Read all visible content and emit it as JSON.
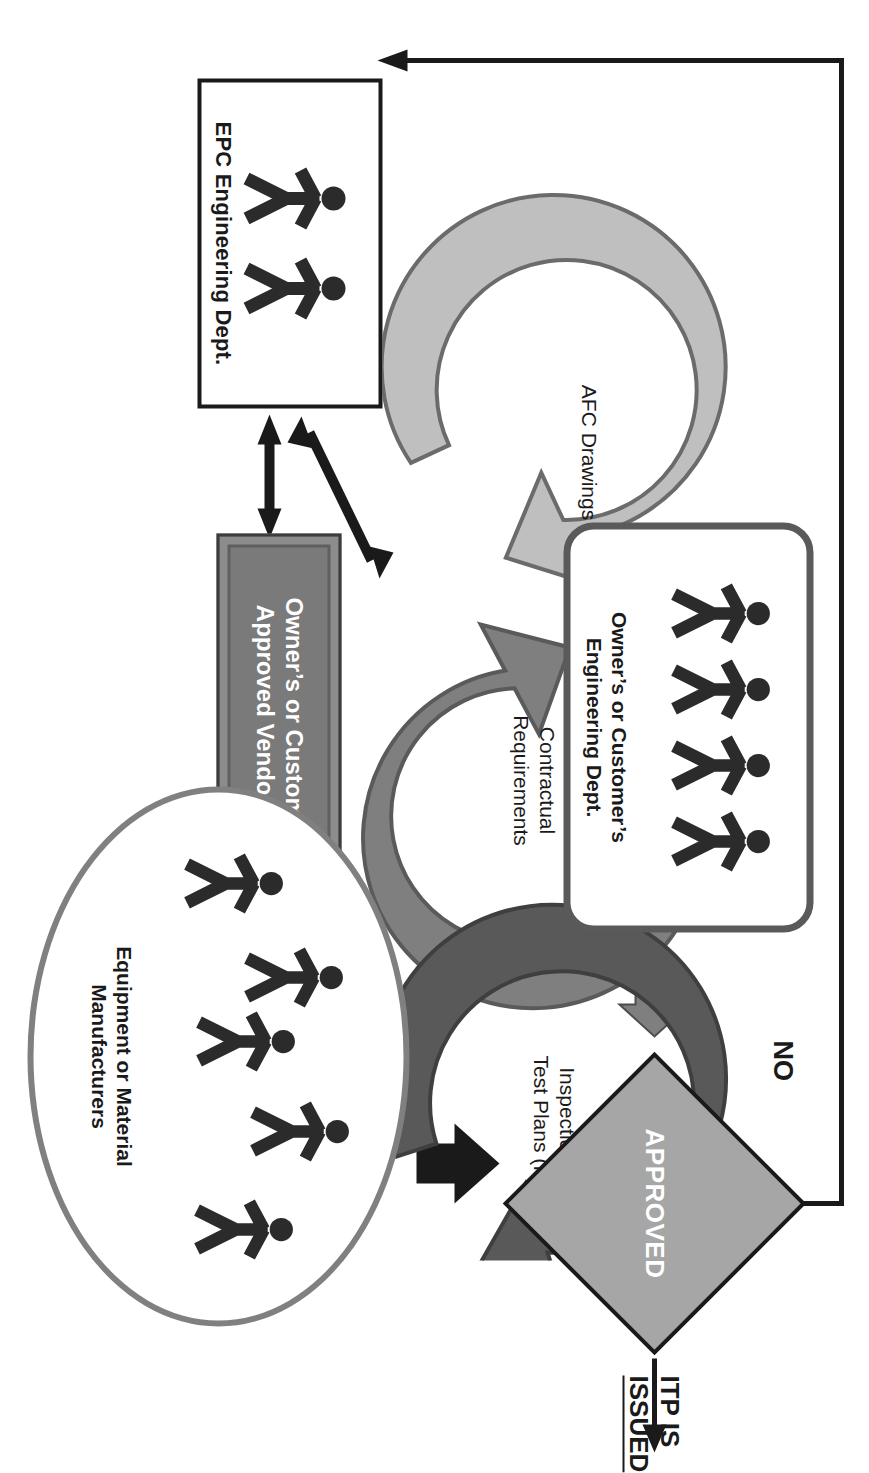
{
  "diagram": {
    "title_text_visible": false,
    "orientation": "rotated-90",
    "nodes": {
      "epc_engineering": {
        "label": "EPC Engineering Dept.",
        "people_count": 2,
        "shape": "rectangle"
      },
      "owner_engineering": {
        "label": "Owner’s or Customer’s\nEngineering Dept.",
        "line1": "Owner’s or Customer’s",
        "line2": "Engineering Dept.",
        "people_count": 4,
        "shape": "rounded-rectangle"
      },
      "vendor_list": {
        "line1": "Owner’s or Customer’s",
        "line2": "Approved Vendor List",
        "shape": "beveled-bar"
      },
      "manufacturers": {
        "line1": "Equipment or Material",
        "line2": "Manufacturers",
        "people_count": 5,
        "shape": "ellipse"
      },
      "decision": {
        "label": "APPROVED",
        "shape": "diamond",
        "no_branch_label": "NO"
      },
      "outcome": {
        "label": "ITP IS ISSUED"
      }
    },
    "cycles": [
      {
        "id": "afc",
        "label": "AFC Drawings",
        "color": "#bfbfbf"
      },
      {
        "id": "contractual",
        "line1": "Contractual",
        "line2": "Requirements",
        "color": "#7f7f7f"
      },
      {
        "id": "itps",
        "line1": "Inspection and",
        "line2": "Test Plans (ITPs)",
        "color": "#595959"
      }
    ],
    "colors": {
      "diamond_fill": "#a6a6a6",
      "cycle_light": "#bfbfbf",
      "cycle_medium": "#7f7f7f",
      "cycle_dark": "#595959",
      "vendor_fill": "#7a7a7a",
      "outline_dark": "#1a1a1a",
      "outline_gray": "#5a5a5a",
      "oval_border": "#808080",
      "person_fill": "#2b2b2b",
      "page_background": "#ffffff"
    },
    "icons": {
      "person": "person-icon",
      "arrow_right": "arrow-right-icon",
      "arrow_double": "double-headed-arrow-icon",
      "block_arrow": "block-arrow-icon"
    }
  }
}
